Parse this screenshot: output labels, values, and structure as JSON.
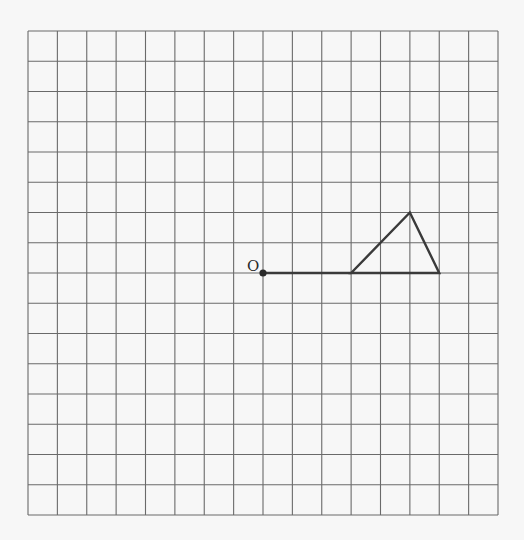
{
  "diagram": {
    "type": "grid-geometry",
    "grid": {
      "columns": 16,
      "rows": 16,
      "left": 28,
      "top": 31,
      "cell_width": 29.375,
      "cell_height": 30.25,
      "line_color": "#6a6a6a",
      "background": "#f7f7f7"
    },
    "origin": {
      "label": "O",
      "col": 8,
      "row": 8
    },
    "segment": {
      "from": {
        "col": 8,
        "row": 8
      },
      "to": {
        "col": 11,
        "row": 8
      }
    },
    "triangle": {
      "vertices": [
        {
          "col": 11,
          "row": 8
        },
        {
          "col": 13,
          "row": 6
        },
        {
          "col": 14,
          "row": 8
        }
      ]
    },
    "figure_color": "#3a3a3a"
  }
}
